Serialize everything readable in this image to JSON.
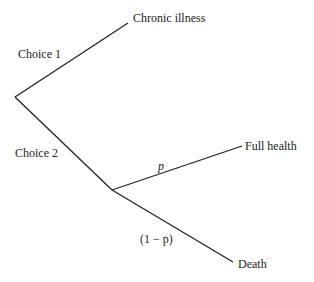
{
  "diagram": {
    "type": "decision-tree",
    "choices": [
      {
        "label": "Choice 1",
        "outcome": "Chronic illness"
      },
      {
        "label": "Choice 2",
        "branches": [
          {
            "prob": "p",
            "outcome": "Full health"
          },
          {
            "prob": "(1 − p)",
            "outcome": "Death"
          }
        ]
      }
    ]
  }
}
